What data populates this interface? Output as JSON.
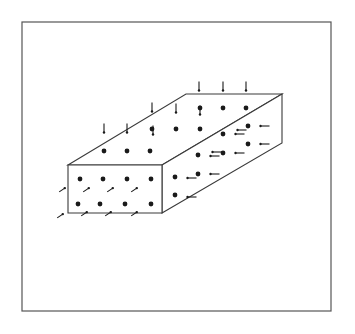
{
  "figure": {
    "width": 355,
    "height": 334,
    "background": "#ffffff",
    "ink": "#1a1a1a",
    "frame": {
      "x": 22,
      "y": 22,
      "w": 309,
      "h": 289,
      "stroke": "#555555",
      "stroke_width": 1.2
    },
    "box": {
      "stroke": "#3a3a3a",
      "stroke_width": 1.1,
      "front_face": [
        [
          68,
          165
        ],
        [
          162,
          165
        ],
        [
          162,
          213
        ],
        [
          68,
          213
        ]
      ],
      "top_face": [
        [
          68,
          165
        ],
        [
          186,
          94
        ],
        [
          282,
          94
        ],
        [
          162,
          165
        ]
      ],
      "right_face": [
        [
          162,
          165
        ],
        [
          282,
          94
        ],
        [
          282,
          143
        ],
        [
          162,
          213
        ]
      ]
    },
    "dots": {
      "radius": 2.4,
      "front": [
        [
          80,
          179
        ],
        [
          103,
          179
        ],
        [
          127,
          179
        ],
        [
          151,
          179
        ],
        [
          78,
          204
        ],
        [
          100,
          204
        ],
        [
          125,
          204
        ],
        [
          151,
          204
        ]
      ],
      "top": [
        [
          104,
          151
        ],
        [
          127,
          151
        ],
        [
          150,
          151
        ],
        [
          152,
          129
        ],
        [
          176,
          129
        ],
        [
          200,
          129
        ],
        [
          200,
          108
        ],
        [
          223,
          108
        ],
        [
          246,
          108
        ]
      ],
      "right": [
        [
          175,
          177
        ],
        [
          198,
          174
        ],
        [
          175,
          195
        ],
        [
          198,
          155
        ],
        [
          223,
          153
        ],
        [
          248,
          144
        ],
        [
          223,
          134
        ],
        [
          248,
          126
        ]
      ]
    },
    "vertical_ticks": {
      "length": 9,
      "items": [
        [
          104,
          128
        ],
        [
          127,
          128
        ],
        [
          152,
          107
        ],
        [
          176,
          108
        ],
        [
          199,
          86
        ],
        [
          223,
          86
        ],
        [
          246,
          86
        ],
        [
          153,
          130
        ],
        [
          200,
          110
        ]
      ]
    },
    "horizontal_ticks": {
      "length": 9,
      "items": [
        [
          265,
          126
        ],
        [
          265,
          144
        ],
        [
          240,
          134
        ],
        [
          240,
          153
        ],
        [
          215,
          156
        ],
        [
          215,
          174
        ],
        [
          192,
          178
        ],
        [
          192,
          197
        ],
        [
          242,
          130
        ],
        [
          217,
          152
        ]
      ]
    },
    "diagonal_ticks": {
      "length": 9,
      "items": [
        [
          62,
          190
        ],
        [
          86,
          190
        ],
        [
          110,
          190
        ],
        [
          134,
          190
        ],
        [
          60,
          216
        ],
        [
          84,
          214
        ],
        [
          108,
          214
        ],
        [
          134,
          214
        ]
      ]
    }
  }
}
